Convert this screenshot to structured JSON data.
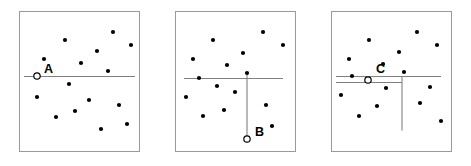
{
  "figure": {
    "width": 471,
    "height": 166,
    "background_color": "#ffffff",
    "frame_color": "#9a9a9a",
    "dot_color": "#000000",
    "line_color": "#808080",
    "label_color": "#000000",
    "dot_radius": 2.1,
    "event_radius": 3.2
  },
  "panels": [
    {
      "id": "panel-a",
      "label": "A",
      "label_position": {
        "x": 44,
        "y": 73
      },
      "event_marker": {
        "x": 37,
        "y": 76
      },
      "frame": {
        "x": 19,
        "y": 11,
        "width": 120,
        "height": 140
      },
      "lines": [
        {
          "name": "sweep-line-horizontal",
          "x1": 24,
          "y1": 76,
          "x2": 135,
          "y2": 76
        }
      ],
      "points": [
        {
          "x": 65,
          "y": 40
        },
        {
          "x": 113,
          "y": 32
        },
        {
          "x": 131,
          "y": 45
        },
        {
          "x": 44,
          "y": 59
        },
        {
          "x": 97,
          "y": 51
        },
        {
          "x": 81,
          "y": 63
        },
        {
          "x": 108,
          "y": 71
        },
        {
          "x": 69,
          "y": 84
        },
        {
          "x": 89,
          "y": 100
        },
        {
          "x": 37,
          "y": 97
        },
        {
          "x": 75,
          "y": 111
        },
        {
          "x": 119,
          "y": 105
        },
        {
          "x": 56,
          "y": 117
        },
        {
          "x": 101,
          "y": 129
        },
        {
          "x": 127,
          "y": 124
        }
      ]
    },
    {
      "id": "panel-b",
      "label": "B",
      "label_position": {
        "x": 255,
        "y": 136
      },
      "event_marker": {
        "x": 247,
        "y": 139
      },
      "frame": {
        "x": 175,
        "y": 11,
        "width": 120,
        "height": 140
      },
      "lines": [
        {
          "name": "sweep-line-horizontal",
          "x1": 184,
          "y1": 78,
          "x2": 283,
          "y2": 78
        },
        {
          "name": "sweep-line-vertical",
          "x1": 247,
          "y1": 73,
          "x2": 247,
          "y2": 139
        }
      ],
      "points": [
        {
          "x": 213,
          "y": 40
        },
        {
          "x": 263,
          "y": 32
        },
        {
          "x": 283,
          "y": 45
        },
        {
          "x": 193,
          "y": 59
        },
        {
          "x": 243,
          "y": 53
        },
        {
          "x": 227,
          "y": 65
        },
        {
          "x": 247,
          "y": 73
        },
        {
          "x": 199,
          "y": 78
        },
        {
          "x": 217,
          "y": 86
        },
        {
          "x": 235,
          "y": 92
        },
        {
          "x": 186,
          "y": 97
        },
        {
          "x": 224,
          "y": 110
        },
        {
          "x": 266,
          "y": 105
        },
        {
          "x": 203,
          "y": 116
        },
        {
          "x": 272,
          "y": 126
        }
      ]
    },
    {
      "id": "panel-c",
      "label": "C",
      "label_position": {
        "x": 376,
        "y": 73
      },
      "event_marker": {
        "x": 368,
        "y": 80
      },
      "frame": {
        "x": 331,
        "y": 11,
        "width": 120,
        "height": 140
      },
      "lines": [
        {
          "name": "sweep-line-horizontal-upper",
          "x1": 336,
          "y1": 76,
          "x2": 441,
          "y2": 76
        },
        {
          "name": "sweep-line-horizontal-lower",
          "x1": 336,
          "y1": 82,
          "x2": 402,
          "y2": 82
        },
        {
          "name": "sweep-line-vertical",
          "x1": 402,
          "y1": 76,
          "x2": 402,
          "y2": 130
        }
      ],
      "points": [
        {
          "x": 369,
          "y": 40
        },
        {
          "x": 417,
          "y": 32
        },
        {
          "x": 437,
          "y": 45
        },
        {
          "x": 349,
          "y": 59
        },
        {
          "x": 399,
          "y": 52
        },
        {
          "x": 383,
          "y": 64
        },
        {
          "x": 404,
          "y": 72
        },
        {
          "x": 352,
          "y": 76
        },
        {
          "x": 386,
          "y": 88
        },
        {
          "x": 341,
          "y": 95
        },
        {
          "x": 430,
          "y": 87
        },
        {
          "x": 377,
          "y": 106
        },
        {
          "x": 420,
          "y": 103
        },
        {
          "x": 359,
          "y": 116
        },
        {
          "x": 441,
          "y": 121
        }
      ]
    }
  ]
}
